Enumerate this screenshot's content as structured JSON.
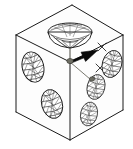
{
  "figure": {
    "title": "Isometric cube with wireframe lobe objects",
    "background_color": "#ffffff",
    "line_color": "#1a1a1a",
    "accent_color": "#0a0a0a",
    "axis_color": "#5a5a52",
    "width_px": 133,
    "height_px": 149
  },
  "cube": {
    "name": "isometric-cube",
    "vertices": {
      "top": [
        72,
        5
      ],
      "left_upper": [
        16,
        35
      ],
      "right_upper": [
        123,
        35
      ],
      "center_upper": [
        70,
        62
      ],
      "left_lower": [
        16,
        112
      ],
      "right_lower": [
        123,
        110
      ],
      "bottom": [
        70,
        140
      ]
    },
    "faces": [
      "top-face",
      "left-face",
      "right-face"
    ],
    "edge_count": 9
  },
  "axes": {
    "name": "coordinate-axes",
    "vertical_label": "",
    "rays": [
      {
        "name": "axis-up",
        "from": [
          70,
          62
        ],
        "to": [
          70,
          30
        ]
      },
      {
        "name": "axis-down",
        "from": [
          70,
          62
        ],
        "to": [
          70,
          140
        ]
      },
      {
        "name": "axis-lower-right",
        "from": [
          70,
          62
        ],
        "to": [
          97,
          84
        ]
      }
    ],
    "tick_marks": [
      "x-tick-upper",
      "x-tick-lower"
    ]
  },
  "arrow": {
    "name": "direction-arrow",
    "from": [
      70,
      62
    ],
    "to": [
      98,
      50
    ],
    "color": "#0a0a0a",
    "style": "solid-filled-head"
  },
  "objects": [
    {
      "id": "dome-top",
      "name": "dome-mesh-top",
      "cx": 70,
      "cy": 32,
      "rx": 22,
      "ry": 11,
      "type": "dome",
      "face": "top"
    },
    {
      "id": "cone-left-upper",
      "name": "cone-mesh-left-upper",
      "cx": 33,
      "cy": 67,
      "rx": 11,
      "ry": 16,
      "type": "ellipse",
      "face": "left"
    },
    {
      "id": "cone-left-lower",
      "name": "cone-mesh-left-lower",
      "cx": 52,
      "cy": 104,
      "rx": 11,
      "ry": 15,
      "type": "ellipse",
      "face": "left"
    },
    {
      "id": "cone-right-upper",
      "name": "cone-mesh-right-upper",
      "cx": 112,
      "cy": 64,
      "rx": 10,
      "ry": 14,
      "type": "ellipse",
      "face": "right"
    },
    {
      "id": "cone-right-mid",
      "name": "cone-mesh-right-middle",
      "cx": 96,
      "cy": 87,
      "rx": 9,
      "ry": 13,
      "type": "ellipse",
      "face": "right"
    },
    {
      "id": "cone-right-lower",
      "name": "cone-mesh-right-lower",
      "cx": 89,
      "cy": 114,
      "rx": 9,
      "ry": 11,
      "type": "ellipse",
      "face": "right"
    }
  ],
  "counts": {
    "mesh_objects": 6,
    "arrows": 1
  }
}
